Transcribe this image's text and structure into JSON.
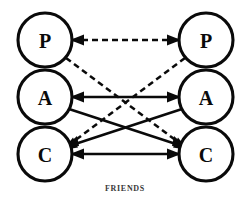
{
  "figure": {
    "caption": "FRIENDS",
    "type": "transactional-analysis-ego-state-diagram",
    "background_color": "#ffffff",
    "ink_color": "#0a0a0a",
    "caption_color": "#3a3a3a"
  },
  "columns": [
    {
      "id": "left",
      "name": "left-person",
      "center_x": 45,
      "states": [
        {
          "id": "left-parent",
          "label": "P",
          "name": "Parent",
          "cx": 45,
          "cy": 40,
          "r": 27
        },
        {
          "id": "left-adult",
          "label": "A",
          "name": "Adult",
          "cx": 45,
          "cy": 97,
          "r": 27
        },
        {
          "id": "left-child",
          "label": "C",
          "name": "Child",
          "cx": 45,
          "cy": 154,
          "r": 27
        }
      ]
    },
    {
      "id": "right",
      "name": "right-person",
      "center_x": 206,
      "states": [
        {
          "id": "right-parent",
          "label": "P",
          "name": "Parent",
          "cx": 206,
          "cy": 40,
          "r": 27
        },
        {
          "id": "right-adult",
          "label": "A",
          "name": "Adult",
          "cx": 206,
          "cy": 97,
          "r": 27
        },
        {
          "id": "right-child",
          "label": "C",
          "name": "Child",
          "cx": 206,
          "cy": 154,
          "r": 27
        }
      ]
    }
  ],
  "transactions": [
    {
      "id": "pp",
      "name": "parent-to-parent-dashed",
      "style": "dashed",
      "from": "left-parent",
      "to": "right-parent",
      "arrows": "both",
      "x1": 72,
      "y1": 40,
      "x2": 179,
      "y2": 40
    },
    {
      "id": "lp-rc",
      "name": "left-parent-to-right-child-dashed",
      "style": "dashed",
      "from": "left-parent",
      "to": "right-child",
      "arrows": "end",
      "x1": 66,
      "y1": 58,
      "x2": 186,
      "y2": 148
    },
    {
      "id": "rp-lc",
      "name": "right-parent-to-left-child-dashed",
      "style": "dashed",
      "from": "right-parent",
      "to": "left-child",
      "arrows": "end",
      "x1": 185,
      "y1": 58,
      "x2": 65,
      "y2": 148
    },
    {
      "id": "aa",
      "name": "adult-to-adult-solid",
      "style": "solid",
      "from": "left-adult",
      "to": "right-adult",
      "arrows": "both",
      "x1": 72,
      "y1": 97,
      "x2": 179,
      "y2": 97
    },
    {
      "id": "la-rc",
      "name": "left-adult-to-right-child-solid",
      "style": "solid",
      "from": "left-adult",
      "to": "right-child",
      "arrows": "end",
      "x1": 69,
      "y1": 109,
      "x2": 185,
      "y2": 147
    },
    {
      "id": "ra-lc",
      "name": "right-adult-to-left-child-solid",
      "style": "solid",
      "from": "right-adult",
      "to": "left-child",
      "arrows": "end",
      "x1": 182,
      "y1": 109,
      "x2": 66,
      "y2": 147
    },
    {
      "id": "cc",
      "name": "child-to-child-solid",
      "style": "solid",
      "from": "left-child",
      "to": "right-child",
      "arrows": "both",
      "x1": 72,
      "y1": 154,
      "x2": 179,
      "y2": 154
    }
  ],
  "caption_position": {
    "x": 125,
    "y": 188
  }
}
